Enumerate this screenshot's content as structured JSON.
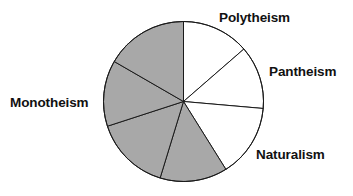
{
  "figure": {
    "title": "",
    "background_color": "#ffffff"
  },
  "labels": {
    "polytheism": "Polytheism",
    "pantheism": "Pantheism",
    "naturalism": "Naturalism",
    "monotheism": "Monotheism"
  },
  "colors": {
    "slice_white": "#ffffff",
    "slice_gray": "#a8a8a8",
    "outline": "#1a1a1a",
    "label_text": "#111111"
  },
  "geometry": {
    "center_x": 183.5,
    "center_y": 101.5,
    "radius": 80
  },
  "chart_data": {
    "type": "pie",
    "title": "",
    "categories": [
      "Polytheism",
      "Pantheism",
      "Naturalism",
      "Unlabeled slice 4",
      "Unlabeled slice 5",
      "Monotheism",
      "Unlabeled slice 7"
    ],
    "values": [
      49,
      46,
      53,
      49,
      55,
      48,
      60
    ],
    "units": "degrees",
    "legend": "none",
    "grid": false,
    "slices": [
      {
        "label": "Polytheism",
        "start_angle_deg": 0,
        "end_angle_deg": 49,
        "sweep_deg": 49,
        "fill": "white",
        "percent": 13.6
      },
      {
        "label": "Pantheism",
        "start_angle_deg": 49,
        "end_angle_deg": 95,
        "sweep_deg": 46,
        "fill": "white",
        "percent": 12.8
      },
      {
        "label": "Naturalism",
        "start_angle_deg": 95,
        "end_angle_deg": 148,
        "sweep_deg": 53,
        "fill": "white",
        "percent": 14.7
      },
      {
        "label": "",
        "start_angle_deg": 148,
        "end_angle_deg": 197,
        "sweep_deg": 49,
        "fill": "gray",
        "percent": 13.6
      },
      {
        "label": "",
        "start_angle_deg": 197,
        "end_angle_deg": 252,
        "sweep_deg": 55,
        "fill": "gray",
        "percent": 15.3
      },
      {
        "label": "Monotheism",
        "start_angle_deg": 252,
        "end_angle_deg": 300,
        "sweep_deg": 48,
        "fill": "gray",
        "percent": 13.3
      },
      {
        "label": "",
        "start_angle_deg": 300,
        "end_angle_deg": 360,
        "sweep_deg": 60,
        "fill": "gray",
        "percent": 16.7
      }
    ]
  }
}
